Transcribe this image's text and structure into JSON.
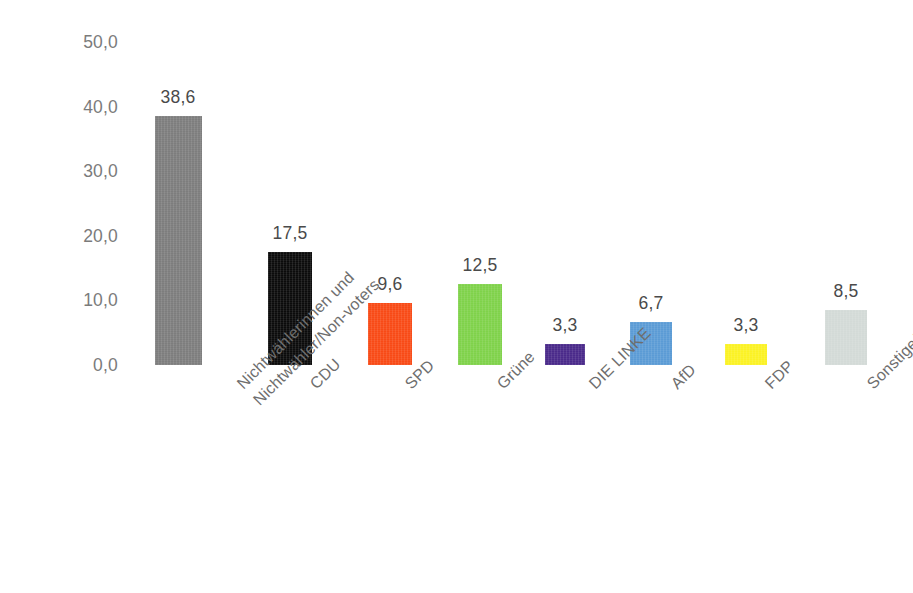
{
  "chart_data": {
    "type": "bar",
    "title": "",
    "subtitle": "",
    "xlabel": "",
    "ylabel": "",
    "ylim": [
      0,
      50
    ],
    "grid": false,
    "legend": "none",
    "decimal_separator": ",",
    "categories": [
      "Nichtwählerinnen und Nichtwähler/Non-voters",
      "CDU",
      "SPD",
      "Grüne",
      "DIE LINKE",
      "AfD",
      "FDP",
      "Sonstige/Others"
    ],
    "category_lines": [
      [
        "Nichtwählerinnen und",
        "Nichtwähler/Non-voters"
      ],
      [
        "CDU"
      ],
      [
        "SPD"
      ],
      [
        "Grüne"
      ],
      [
        "DIE LINKE"
      ],
      [
        "AfD"
      ],
      [
        "FDP"
      ],
      [
        "Sonstige/Others"
      ]
    ],
    "values": [
      38.6,
      17.5,
      9.6,
      12.5,
      3.3,
      6.7,
      3.3,
      8.5
    ],
    "value_labels": [
      "38,6",
      "17,5",
      "9,6",
      "12,5",
      "3,3",
      "6,7",
      "3,3",
      "8,5"
    ],
    "colors": [
      "#7d7d7d",
      "#0b0b0b",
      "#f84a16",
      "#7fd24a",
      "#4a2a8a",
      "#5b9bd5",
      "#fbf224",
      "#d3dad7"
    ],
    "yticks": [
      0,
      10,
      20,
      30,
      40,
      50
    ],
    "ytick_labels": [
      "0,0",
      "10,0",
      "20,0",
      "30,0",
      "40,0",
      "50,0"
    ]
  },
  "axis_color": "#7b7b7b",
  "label_color": "#6e6e6e",
  "value_color": "#4a4a4a",
  "background": "#ffffff"
}
